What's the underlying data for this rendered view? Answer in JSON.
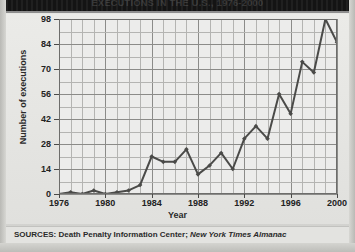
{
  "figure": {
    "title": "EXECUTIONS IN THE U.S., 1976-2000",
    "source_prefix": "SOURCES: Death Penalty Information Center; ",
    "source_italic": "New York Times Almanac"
  },
  "chart_data": {
    "type": "line",
    "title": "EXECUTIONS IN THE U.S., 1976-2000",
    "xlabel": "Year",
    "ylabel": "Number of executions",
    "xlim": [
      1976,
      2000
    ],
    "ylim": [
      0,
      98
    ],
    "grid": true,
    "legend": null,
    "y_ticks": [
      0,
      14,
      28,
      42,
      56,
      70,
      84,
      98
    ],
    "x_ticks": [
      1976,
      1980,
      1984,
      1988,
      1992,
      1996,
      2000
    ],
    "x": [
      1976,
      1977,
      1978,
      1979,
      1980,
      1981,
      1982,
      1983,
      1984,
      1985,
      1986,
      1987,
      1988,
      1989,
      1990,
      1991,
      1992,
      1993,
      1994,
      1995,
      1996,
      1997,
      1998,
      1999,
      2000
    ],
    "values": [
      0,
      1,
      0,
      2,
      0,
      1,
      2,
      5,
      21,
      18,
      18,
      25,
      11,
      16,
      23,
      14,
      31,
      38,
      31,
      56,
      45,
      74,
      68,
      98,
      85
    ],
    "marker": "diamond",
    "line_color": "#4a4a48"
  }
}
